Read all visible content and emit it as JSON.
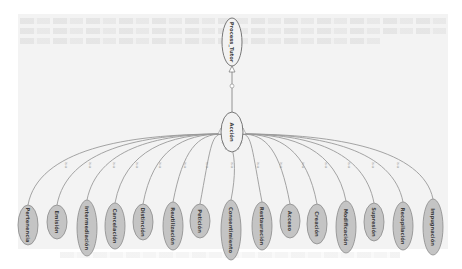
{
  "diagram": {
    "type": "class-hierarchy",
    "root": {
      "label": "Process_Tutor"
    },
    "middle": {
      "label": "Acción"
    },
    "edge_label": "is-a",
    "children": [
      {
        "label": "Pertenencia"
      },
      {
        "label": "Emisión"
      },
      {
        "label": "Intermediación"
      },
      {
        "label": "Cancelación"
      },
      {
        "label": "Distinción"
      },
      {
        "label": "Reutilización"
      },
      {
        "label": "Petición"
      },
      {
        "label": "Consentimiento"
      },
      {
        "label": "Restauración"
      },
      {
        "label": "Acceso"
      },
      {
        "label": "Creación"
      },
      {
        "label": "Modificación"
      },
      {
        "label": "Supresión"
      },
      {
        "label": "Recopilación"
      },
      {
        "label": "Impugnación"
      }
    ],
    "colors": {
      "root_fill": "#f2f2f2",
      "child_fill": "#c4c4c4",
      "stroke": "#8a8a8a",
      "background": "#f3f3f3"
    }
  }
}
